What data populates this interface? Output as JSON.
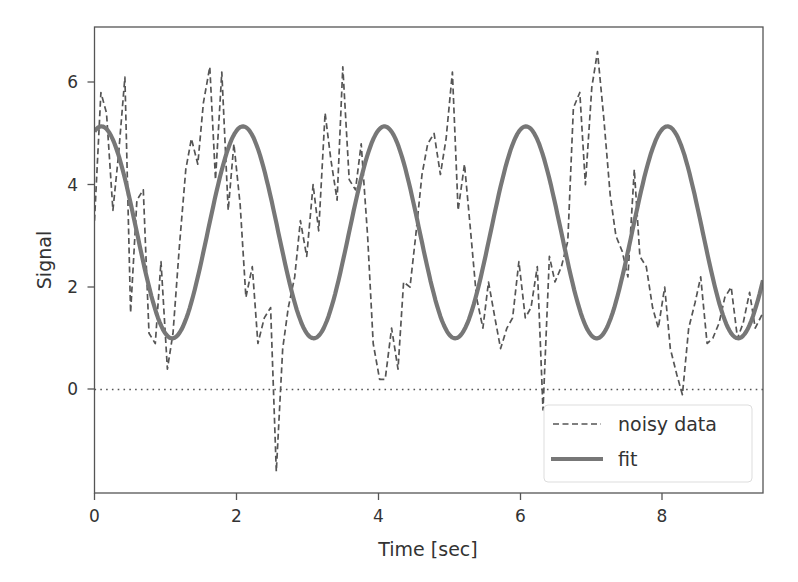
{
  "chart_data": {
    "type": "line",
    "title": "",
    "xlabel": "Time [sec]",
    "ylabel": "Signal",
    "xlim": [
      0,
      9.45
    ],
    "ylim": [
      -2.02,
      7.08
    ],
    "xticks": [
      0,
      2,
      4,
      6,
      8
    ],
    "yticks": [
      0,
      2,
      4,
      6
    ],
    "xtick_labels": [
      "0",
      "2",
      "4",
      "6",
      "8"
    ],
    "ytick_labels": [
      "0",
      "2",
      "4",
      "6"
    ],
    "grid": false,
    "legend_position": "lower right",
    "reference_line": {
      "y": 0,
      "style": "dotted",
      "color": "#555555"
    },
    "series": [
      {
        "name": "noisy data",
        "style": "dashed",
        "color": "#555555",
        "linewidth": 1.5,
        "x": [
          0.0,
          0.09,
          0.17,
          0.26,
          0.34,
          0.43,
          0.51,
          0.6,
          0.69,
          0.77,
          0.86,
          0.94,
          1.03,
          1.11,
          1.2,
          1.29,
          1.37,
          1.46,
          1.54,
          1.63,
          1.71,
          1.8,
          1.89,
          1.97,
          2.06,
          2.14,
          2.23,
          2.31,
          2.4,
          2.49,
          2.57,
          2.66,
          2.74,
          2.83,
          2.91,
          3.0,
          3.09,
          3.17,
          3.26,
          3.34,
          3.43,
          3.51,
          3.6,
          3.69,
          3.77,
          3.86,
          3.94,
          4.03,
          4.11,
          4.2,
          4.29,
          4.37,
          4.46,
          4.54,
          4.63,
          4.71,
          4.8,
          4.89,
          4.97,
          5.06,
          5.14,
          5.23,
          5.31,
          5.4,
          5.49,
          5.57,
          5.66,
          5.74,
          5.83,
          5.91,
          6.0,
          6.09,
          6.17,
          6.26,
          6.34,
          6.43,
          6.51,
          6.6,
          6.69,
          6.77,
          6.86,
          6.94,
          7.03,
          7.11,
          7.2,
          7.29,
          7.37,
          7.46,
          7.54,
          7.63,
          7.71,
          7.8,
          7.89,
          7.97,
          8.06,
          8.14,
          8.23,
          8.31,
          8.4,
          8.49,
          8.57,
          8.66,
          8.74,
          8.83,
          8.91,
          9.0,
          9.09,
          9.17,
          9.26,
          9.34,
          9.45
        ],
        "y": [
          3.3,
          5.8,
          5.4,
          3.5,
          4.6,
          6.1,
          1.5,
          3.7,
          3.9,
          1.1,
          0.9,
          2.5,
          0.4,
          1.1,
          2.8,
          4.3,
          4.9,
          4.4,
          5.6,
          6.3,
          4.1,
          6.2,
          3.5,
          4.8,
          3.6,
          1.8,
          2.4,
          0.9,
          1.4,
          1.6,
          -1.6,
          0.8,
          1.6,
          2.2,
          3.3,
          2.6,
          4.0,
          3.1,
          5.4,
          4.5,
          3.7,
          6.3,
          4.1,
          3.9,
          4.8,
          3.0,
          0.9,
          0.2,
          0.2,
          1.2,
          0.4,
          2.1,
          2.0,
          3.0,
          4.2,
          4.8,
          5.0,
          4.2,
          4.9,
          6.2,
          3.5,
          4.4,
          3.2,
          1.8,
          1.2,
          2.1,
          1.4,
          0.8,
          1.2,
          1.4,
          2.5,
          1.4,
          1.6,
          2.4,
          -0.4,
          2.6,
          2.1,
          2.4,
          2.9,
          5.5,
          5.8,
          4.0,
          5.9,
          6.6,
          5.3,
          3.8,
          3.0,
          2.7,
          2.2,
          4.3,
          2.6,
          2.4,
          1.6,
          1.2,
          2.0,
          0.8,
          0.3,
          -0.1,
          1.2,
          1.7,
          2.2,
          0.9,
          1.0,
          1.3,
          1.8,
          2.0,
          1.0,
          1.3,
          1.9,
          1.2,
          1.5
        ]
      },
      {
        "name": "fit",
        "style": "solid",
        "color": "#777777",
        "linewidth": 4,
        "model": "3.07 + 2.07*sin(pi*t + 1.26)",
        "params": {
          "offset": 3.07,
          "amplitude": 2.07,
          "period": 2.0,
          "phase": 1.26
        },
        "peaks": [
          [
            0.2,
            5.14
          ],
          [
            2.2,
            5.14
          ],
          [
            4.2,
            5.14
          ],
          [
            6.2,
            5.14
          ],
          [
            8.2,
            5.14
          ]
        ],
        "troughs": [
          [
            1.2,
            1.0
          ],
          [
            3.2,
            1.0
          ],
          [
            5.2,
            1.0
          ],
          [
            7.2,
            1.0
          ],
          [
            9.2,
            1.0
          ]
        ]
      }
    ]
  },
  "axes": {
    "xlabel": "Time [sec]",
    "ylabel": "Signal",
    "xticks": [
      "0",
      "2",
      "4",
      "6",
      "8"
    ],
    "yticks": [
      "0",
      "2",
      "4",
      "6"
    ]
  },
  "legend": {
    "items": [
      {
        "label": "noisy data",
        "style": "dashed"
      },
      {
        "label": "fit",
        "style": "solid"
      }
    ]
  }
}
